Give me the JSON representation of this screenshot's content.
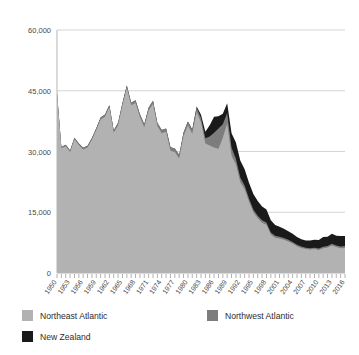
{
  "chart_data": {
    "type": "area",
    "title": "",
    "subtitle": "",
    "xlabel": "",
    "ylabel": "",
    "stacked": true,
    "grid": true,
    "legend_position": "bottom",
    "xlim": [
      1950,
      2016
    ],
    "ylim": [
      0,
      60000
    ],
    "yticks": [
      0,
      15000,
      30000,
      45000,
      60000
    ],
    "ytick_labels": [
      "0",
      "15,000",
      "30,000",
      "45,000",
      "60,000"
    ],
    "xticks": [
      1950,
      1953,
      1956,
      1959,
      1962,
      1965,
      1968,
      1971,
      1974,
      1977,
      1980,
      1983,
      1986,
      1989,
      1992,
      1995,
      1998,
      2001,
      2004,
      2007,
      2010,
      2013,
      2016
    ],
    "xtick_labels": [
      "1950",
      "1953",
      "1956",
      "1959",
      "1962",
      "1965",
      "1968",
      "1971",
      "1974",
      "1977",
      "1980",
      "1983",
      "1986",
      "1989",
      "1992",
      "1995",
      "1998",
      "2001",
      "2004",
      "2007",
      "2010",
      "2013",
      "2016"
    ],
    "x": [
      1950,
      1951,
      1952,
      1953,
      1954,
      1955,
      1956,
      1957,
      1958,
      1959,
      1960,
      1961,
      1962,
      1963,
      1964,
      1965,
      1966,
      1967,
      1968,
      1969,
      1970,
      1971,
      1972,
      1973,
      1974,
      1975,
      1976,
      1977,
      1978,
      1979,
      1980,
      1981,
      1982,
      1983,
      1984,
      1985,
      1986,
      1987,
      1988,
      1989,
      1990,
      1991,
      1992,
      1993,
      1994,
      1995,
      1996,
      1997,
      1998,
      1999,
      2000,
      2001,
      2002,
      2003,
      2004,
      2005,
      2006,
      2007,
      2008,
      2009,
      2010,
      2011,
      2012,
      2013,
      2014,
      2015,
      2016
    ],
    "colors": {
      "Northeast Atlantic": "#b2b2b2",
      "Northwest Atlantic": "#7d7d7d",
      "New Zealand": "#1a1a1a"
    },
    "series": [
      {
        "name": "Northeast Atlantic",
        "color": "#b2b2b2",
        "values": [
          44200,
          30800,
          31300,
          29900,
          33000,
          31600,
          30500,
          31000,
          32900,
          35300,
          37900,
          38600,
          40900,
          34600,
          36500,
          41400,
          45700,
          41400,
          42000,
          38500,
          36000,
          40100,
          41800,
          36300,
          34500,
          34900,
          30200,
          29900,
          28300,
          33800,
          36500,
          34400,
          39800,
          37200,
          32000,
          31500,
          31000,
          30700,
          33400,
          36900,
          29000,
          26800,
          22500,
          20700,
          17600,
          15000,
          13500,
          12400,
          11900,
          9500,
          8700,
          8500,
          8200,
          7800,
          7300,
          6600,
          6200,
          5900,
          5800,
          5900,
          5700,
          6100,
          6300,
          6800,
          6400,
          6100,
          6200
        ]
      },
      {
        "name": "Northwest Atlantic",
        "color": "#7d7d7d",
        "values": [
          300,
          320,
          340,
          360,
          380,
          400,
          420,
          430,
          450,
          470,
          490,
          510,
          530,
          560,
          580,
          600,
          620,
          640,
          660,
          680,
          700,
          720,
          740,
          760,
          780,
          800,
          820,
          840,
          860,
          880,
          900,
          950,
          1000,
          1100,
          1300,
          2200,
          3600,
          5000,
          3300,
          2600,
          1900,
          1400,
          1100,
          900,
          800,
          700,
          650,
          600,
          560,
          520,
          480,
          450,
          420,
          400,
          380,
          360,
          340,
          330,
          320,
          330,
          340,
          360,
          380,
          400,
          420,
          430,
          440
        ]
      },
      {
        "name": "New Zealand",
        "color": "#1a1a1a",
        "values": [
          0,
          0,
          0,
          0,
          0,
          0,
          0,
          0,
          0,
          0,
          0,
          0,
          0,
          0,
          0,
          0,
          0,
          0,
          0,
          0,
          0,
          0,
          0,
          0,
          0,
          0,
          0,
          0,
          0,
          0,
          0,
          100,
          300,
          800,
          1600,
          2800,
          4000,
          3000,
          2600,
          2400,
          3600,
          4000,
          4200,
          4000,
          3900,
          3800,
          3600,
          3400,
          3200,
          3000,
          2700,
          2500,
          2300,
          2100,
          2000,
          1900,
          1800,
          1800,
          1900,
          2000,
          2100,
          2400,
          2300,
          2500,
          2400,
          2600,
          2500
        ]
      }
    ]
  },
  "legend": {
    "items": [
      {
        "label": "Northeast Atlantic",
        "color": "#b2b2b2"
      },
      {
        "label": "Northwest Atlantic",
        "color": "#7d7d7d"
      },
      {
        "label": "New Zealand",
        "color": "#1a1a1a"
      }
    ]
  }
}
